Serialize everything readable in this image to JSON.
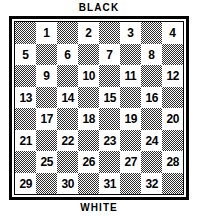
{
  "diagram": {
    "top_label": "BLACK",
    "bottom_label": "WHITE"
  },
  "board": {
    "rows": 8,
    "columns": 8,
    "numbered_square_count": 32,
    "dark_square_color": "#2b2b2b",
    "light_square_color": "#ffffff",
    "border_color": "#000000",
    "squares": [
      [
        {
          "shade": "dark",
          "number": ""
        },
        {
          "shade": "light",
          "number": "1"
        },
        {
          "shade": "dark",
          "number": ""
        },
        {
          "shade": "light",
          "number": "2"
        },
        {
          "shade": "dark",
          "number": ""
        },
        {
          "shade": "light",
          "number": "3"
        },
        {
          "shade": "dark",
          "number": ""
        },
        {
          "shade": "light",
          "number": "4"
        }
      ],
      [
        {
          "shade": "light",
          "number": "5"
        },
        {
          "shade": "dark",
          "number": ""
        },
        {
          "shade": "light",
          "number": "6"
        },
        {
          "shade": "dark",
          "number": ""
        },
        {
          "shade": "light",
          "number": "7"
        },
        {
          "shade": "dark",
          "number": ""
        },
        {
          "shade": "light",
          "number": "8"
        },
        {
          "shade": "dark",
          "number": ""
        }
      ],
      [
        {
          "shade": "dark",
          "number": ""
        },
        {
          "shade": "light",
          "number": "9"
        },
        {
          "shade": "dark",
          "number": ""
        },
        {
          "shade": "light",
          "number": "10"
        },
        {
          "shade": "dark",
          "number": ""
        },
        {
          "shade": "light",
          "number": "11"
        },
        {
          "shade": "dark",
          "number": ""
        },
        {
          "shade": "light",
          "number": "12"
        }
      ],
      [
        {
          "shade": "light",
          "number": "13"
        },
        {
          "shade": "dark",
          "number": ""
        },
        {
          "shade": "light",
          "number": "14"
        },
        {
          "shade": "dark",
          "number": ""
        },
        {
          "shade": "light",
          "number": "15"
        },
        {
          "shade": "dark",
          "number": ""
        },
        {
          "shade": "light",
          "number": "16"
        },
        {
          "shade": "dark",
          "number": ""
        }
      ],
      [
        {
          "shade": "dark",
          "number": ""
        },
        {
          "shade": "light",
          "number": "17"
        },
        {
          "shade": "dark",
          "number": ""
        },
        {
          "shade": "light",
          "number": "18"
        },
        {
          "shade": "dark",
          "number": ""
        },
        {
          "shade": "light",
          "number": "19"
        },
        {
          "shade": "dark",
          "number": ""
        },
        {
          "shade": "light",
          "number": "20"
        }
      ],
      [
        {
          "shade": "light",
          "number": "21"
        },
        {
          "shade": "dark",
          "number": ""
        },
        {
          "shade": "light",
          "number": "22"
        },
        {
          "shade": "dark",
          "number": ""
        },
        {
          "shade": "light",
          "number": "23"
        },
        {
          "shade": "dark",
          "number": ""
        },
        {
          "shade": "light",
          "number": "24"
        },
        {
          "shade": "dark",
          "number": ""
        }
      ],
      [
        {
          "shade": "dark",
          "number": ""
        },
        {
          "shade": "light",
          "number": "25"
        },
        {
          "shade": "dark",
          "number": ""
        },
        {
          "shade": "light",
          "number": "26"
        },
        {
          "shade": "dark",
          "number": ""
        },
        {
          "shade": "light",
          "number": "27"
        },
        {
          "shade": "dark",
          "number": ""
        },
        {
          "shade": "light",
          "number": "28"
        }
      ],
      [
        {
          "shade": "light",
          "number": "29"
        },
        {
          "shade": "dark",
          "number": ""
        },
        {
          "shade": "light",
          "number": "30"
        },
        {
          "shade": "dark",
          "number": ""
        },
        {
          "shade": "light",
          "number": "31"
        },
        {
          "shade": "dark",
          "number": ""
        },
        {
          "shade": "light",
          "number": "32"
        },
        {
          "shade": "dark",
          "number": ""
        }
      ]
    ]
  }
}
